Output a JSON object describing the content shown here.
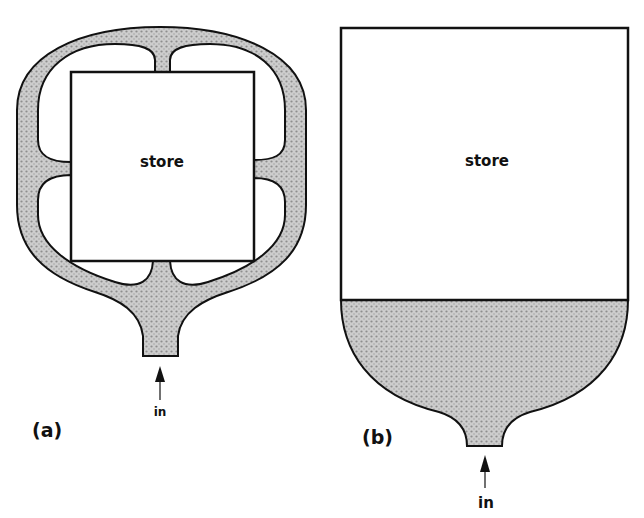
{
  "diagrams": [
    {
      "id": "a",
      "caption": "(a)",
      "store_label": "store",
      "input_label": "in"
    },
    {
      "id": "b",
      "caption": "(b)",
      "store_label": "store",
      "input_label": "in"
    }
  ],
  "colors": {
    "fill_stipple": "#c4c4c4",
    "fill_dot": "#8c8c8c",
    "stroke": "#111111",
    "background": "#ffffff"
  }
}
